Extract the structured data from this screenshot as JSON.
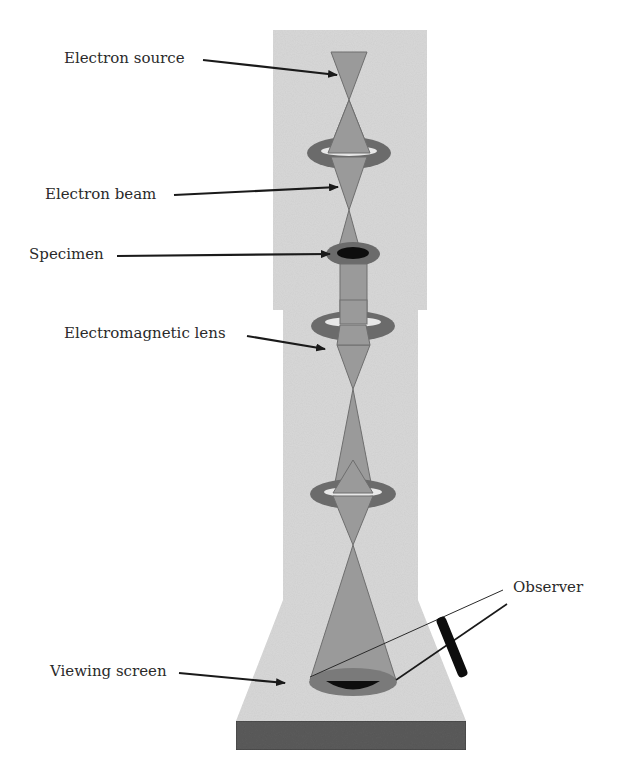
{
  "diagram": {
    "labels": {
      "electron_source": "Electron source",
      "electron_beam": "Electron beam",
      "specimen": "Specimen",
      "electromagnetic_lens": "Electromagnetic lens",
      "viewing_screen": "Viewing screen",
      "observer": "Observer"
    },
    "colors": {
      "column_body": "#d9d9d9",
      "beam": "#9a9a9a",
      "beam_outline": "#6e6e6e",
      "lens_ring": "#6b6b6b",
      "specimen": "#0d0d0d",
      "base": "#5c5c5c",
      "arrow": "#1a1a1a",
      "text": "#2a2a2a"
    }
  }
}
